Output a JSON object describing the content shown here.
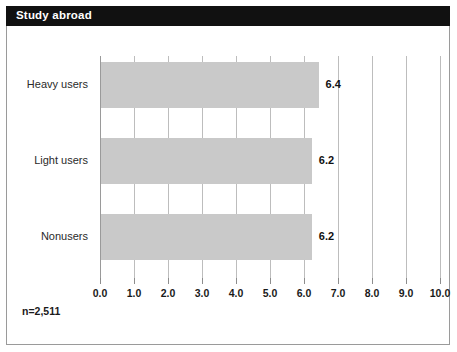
{
  "panel": {
    "title": "Study abroad",
    "footnote": "n=2,511",
    "title_bar_color": "#111111",
    "title_text_color": "#ffffff",
    "bar_color": "#c9c9c9",
    "grid_color": "#bdbdbd",
    "background_color": "#ffffff",
    "border_color": "#9a9a9a"
  },
  "chart_data": {
    "type": "bar",
    "orientation": "horizontal",
    "title": "Study abroad",
    "categories": [
      "Heavy users",
      "Light users",
      "Nonusers"
    ],
    "values": [
      6.4,
      6.2,
      6.2
    ],
    "data_labels": [
      "6.4",
      "6.2",
      "6.2"
    ],
    "xlabel": "",
    "ylabel": "",
    "xlim": [
      0.0,
      10.0
    ],
    "xticks": [
      0.0,
      1.0,
      2.0,
      3.0,
      4.0,
      5.0,
      6.0,
      7.0,
      8.0,
      9.0,
      10.0
    ],
    "xtick_labels": [
      "0.0",
      "1.0",
      "2.0",
      "3.0",
      "4.0",
      "5.0",
      "6.0",
      "7.0",
      "8.0",
      "9.0",
      "10.0"
    ],
    "grid": true,
    "grid_axis": "x",
    "legend": null,
    "annotations": [
      "n=2,511"
    ],
    "sample_size": 2511
  }
}
